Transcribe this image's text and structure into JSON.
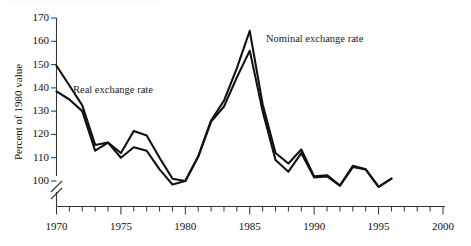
{
  "chart_data": {
    "type": "line",
    "title": "",
    "subtitle": "",
    "xlabel": "",
    "ylabel": "Percent of 1980 value",
    "xlim": [
      1970,
      2000
    ],
    "ylim": [
      97,
      170
    ],
    "y_axis_break": true,
    "y_break_note": "axis broken between 0 and 100",
    "grid": false,
    "legend_position": "inline-annotations",
    "y_ticks": [
      100,
      110,
      120,
      130,
      140,
      150,
      160,
      170
    ],
    "y_tick_labels": [
      "100",
      "110",
      "120",
      "130",
      "140",
      "150",
      "160",
      "170"
    ],
    "x_ticks": [
      1970,
      1975,
      1980,
      1985,
      1990,
      1995,
      2000
    ],
    "x_tick_labels": [
      "1970",
      "1975",
      "1980",
      "1985",
      "1990",
      "1995",
      "2000"
    ],
    "x_minor_tick_step": 1,
    "x": [
      1970,
      1971,
      1972,
      1973,
      1974,
      1975,
      1976,
      1977,
      1978,
      1979,
      1980,
      1981,
      1982,
      1983,
      1984,
      1985,
      1986,
      1987,
      1988,
      1989,
      1990,
      1991,
      1992,
      1993,
      1994,
      1995,
      1996
    ],
    "series": [
      {
        "name": "Nominal exchange rate",
        "color": "#111111",
        "values": [
          149.5,
          141.0,
          132.5,
          115.5,
          116.5,
          112.0,
          121.5,
          119.5,
          110.0,
          101.0,
          100.0,
          110.5,
          126.0,
          134.5,
          148.5,
          164.5,
          133.0,
          112.0,
          107.5,
          113.5,
          102.0,
          102.5,
          98.0,
          106.5,
          105.0,
          97.5,
          101.0
        ]
      },
      {
        "name": "Real exchange rate",
        "color": "#111111",
        "values": [
          138.5,
          135.0,
          130.0,
          113.0,
          116.5,
          110.0,
          114.5,
          113.0,
          105.0,
          98.5,
          100.0,
          110.5,
          125.5,
          132.0,
          144.5,
          156.0,
          130.0,
          109.0,
          104.0,
          112.0,
          101.5,
          102.0,
          98.0,
          106.0,
          105.0,
          97.5,
          101.0
        ]
      }
    ],
    "annotations": [
      {
        "text": "Real exchange rate",
        "x_px": 73,
        "y_px": 93,
        "anchor": "start"
      },
      {
        "text": "Nominal exchange rate",
        "x_px": 266,
        "y_px": 42,
        "anchor": "start"
      }
    ]
  }
}
